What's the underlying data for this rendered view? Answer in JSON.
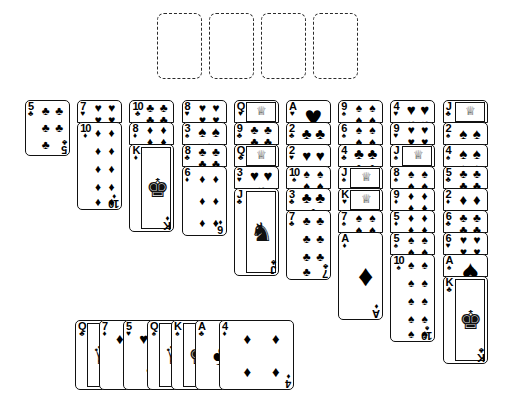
{
  "app": {
    "title": "Solitaire — FreeCell layout",
    "background_color": "#ffffff",
    "card_border_color": "#111111",
    "card_face_color": "#ffffff",
    "placeholder_border_color": "#2b2b2b"
  },
  "suits": {
    "spades": "♠",
    "hearts": "♥",
    "diamonds": "♦",
    "clubs": "♣"
  },
  "free_cells": {
    "count": 4,
    "label": "free-cell",
    "cards": [
      "",
      "",
      "",
      ""
    ]
  },
  "tableau": {
    "column_count": 9,
    "columns": [
      {
        "index": 1,
        "cards": [
          {
            "rank": "5",
            "suit": "clubs",
            "suit_glyph": "♣",
            "pip_count": 5
          }
        ]
      },
      {
        "index": 2,
        "cards": [
          {
            "rank": "7",
            "suit": "hearts",
            "suit_glyph": "♥",
            "pip_count": 7
          },
          {
            "rank": "10",
            "suit": "diamonds",
            "suit_glyph": "♦",
            "pip_count": 10
          }
        ]
      },
      {
        "index": 3,
        "cards": [
          {
            "rank": "10",
            "suit": "clubs",
            "suit_glyph": "♣",
            "pip_count": 10
          },
          {
            "rank": "8",
            "suit": "diamonds",
            "suit_glyph": "♦",
            "pip_count": 8
          },
          {
            "rank": "K",
            "suit": "diamonds",
            "suit_glyph": "♦",
            "pip_count": 0
          }
        ]
      },
      {
        "index": 4,
        "cards": [
          {
            "rank": "8",
            "suit": "hearts",
            "suit_glyph": "♥",
            "pip_count": 8
          },
          {
            "rank": "3",
            "suit": "spades",
            "suit_glyph": "♠",
            "pip_count": 3
          },
          {
            "rank": "8",
            "suit": "clubs",
            "suit_glyph": "♣",
            "pip_count": 8
          },
          {
            "rank": "6",
            "suit": "diamonds",
            "suit_glyph": "♦",
            "pip_count": 6
          }
        ]
      },
      {
        "index": 5,
        "cards": [
          {
            "rank": "Q",
            "suit": "hearts",
            "suit_glyph": "♥",
            "pip_count": 0
          },
          {
            "rank": "9",
            "suit": "clubs",
            "suit_glyph": "♣",
            "pip_count": 9
          },
          {
            "rank": "Q",
            "suit": "clubs",
            "suit_glyph": "♣",
            "pip_count": 0
          },
          {
            "rank": "3",
            "suit": "hearts",
            "suit_glyph": "♥",
            "pip_count": 3
          },
          {
            "rank": "J",
            "suit": "clubs",
            "suit_glyph": "♣",
            "pip_count": 0
          }
        ]
      },
      {
        "index": 6,
        "cards": [
          {
            "rank": "A",
            "suit": "hearts",
            "suit_glyph": "♥",
            "pip_count": 1
          },
          {
            "rank": "2",
            "suit": "clubs",
            "suit_glyph": "♣",
            "pip_count": 2
          },
          {
            "rank": "2",
            "suit": "hearts",
            "suit_glyph": "♥",
            "pip_count": 2
          },
          {
            "rank": "10",
            "suit": "spades",
            "suit_glyph": "♠",
            "pip_count": 10
          },
          {
            "rank": "3",
            "suit": "clubs",
            "suit_glyph": "♣",
            "pip_count": 3
          },
          {
            "rank": "7",
            "suit": "clubs",
            "suit_glyph": "♣",
            "pip_count": 7
          }
        ]
      },
      {
        "index": 7,
        "cards": [
          {
            "rank": "9",
            "suit": "spades",
            "suit_glyph": "♠",
            "pip_count": 9
          },
          {
            "rank": "6",
            "suit": "spades",
            "suit_glyph": "♠",
            "pip_count": 6
          },
          {
            "rank": "4",
            "suit": "clubs",
            "suit_glyph": "♣",
            "pip_count": 4
          },
          {
            "rank": "J",
            "suit": "spades",
            "suit_glyph": "♠",
            "pip_count": 0
          },
          {
            "rank": "K",
            "suit": "hearts",
            "suit_glyph": "♥",
            "pip_count": 0
          },
          {
            "rank": "7",
            "suit": "spades",
            "suit_glyph": "♠",
            "pip_count": 7
          },
          {
            "rank": "A",
            "suit": "diamonds",
            "suit_glyph": "♦",
            "pip_count": 1
          }
        ]
      },
      {
        "index": 8,
        "cards": [
          {
            "rank": "4",
            "suit": "hearts",
            "suit_glyph": "♥",
            "pip_count": 4
          },
          {
            "rank": "9",
            "suit": "hearts",
            "suit_glyph": "♥",
            "pip_count": 9
          },
          {
            "rank": "J",
            "suit": "spades",
            "suit_glyph": "♠",
            "pip_count": 0
          },
          {
            "rank": "8",
            "suit": "spades",
            "suit_glyph": "♠",
            "pip_count": 8
          },
          {
            "rank": "9",
            "suit": "diamonds",
            "suit_glyph": "♦",
            "pip_count": 9
          },
          {
            "rank": "5",
            "suit": "diamonds",
            "suit_glyph": "♦",
            "pip_count": 5
          },
          {
            "rank": "5",
            "suit": "spades",
            "suit_glyph": "♠",
            "pip_count": 5
          },
          {
            "rank": "10",
            "suit": "spades",
            "suit_glyph": "♠",
            "pip_count": 10
          }
        ]
      },
      {
        "index": 9,
        "cards": [
          {
            "rank": "J",
            "suit": "clubs",
            "suit_glyph": "♣",
            "pip_count": 0
          },
          {
            "rank": "2",
            "suit": "spades",
            "suit_glyph": "♠",
            "pip_count": 2
          },
          {
            "rank": "4",
            "suit": "spades",
            "suit_glyph": "♠",
            "pip_count": 4
          },
          {
            "rank": "5",
            "suit": "clubs",
            "suit_glyph": "♣",
            "pip_count": 5
          },
          {
            "rank": "2",
            "suit": "diamonds",
            "suit_glyph": "♦",
            "pip_count": 2
          },
          {
            "rank": "6",
            "suit": "clubs",
            "suit_glyph": "♣",
            "pip_count": 6
          },
          {
            "rank": "6",
            "suit": "hearts",
            "suit_glyph": "♥",
            "pip_count": 6
          },
          {
            "rank": "A",
            "suit": "spades",
            "suit_glyph": "♠",
            "pip_count": 1
          },
          {
            "rank": "K",
            "suit": "clubs",
            "suit_glyph": "♣",
            "pip_count": 0
          }
        ]
      }
    ]
  },
  "waste_row": {
    "label": "reserve-row",
    "cards": [
      {
        "rank": "Q",
        "suit": "clubs",
        "suit_glyph": "♣",
        "pip_count": 0
      },
      {
        "rank": "7",
        "suit": "diamonds",
        "suit_glyph": "♦",
        "pip_count": 3
      },
      {
        "rank": "5",
        "suit": "hearts",
        "suit_glyph": "♥",
        "pip_count": 3
      },
      {
        "rank": "Q",
        "suit": "spades",
        "suit_glyph": "♠",
        "pip_count": 0
      },
      {
        "rank": "K",
        "suit": "spades",
        "suit_glyph": "♠",
        "pip_count": 0
      },
      {
        "rank": "A",
        "suit": "clubs",
        "suit_glyph": "♣",
        "pip_count": 1
      },
      {
        "rank": "4",
        "suit": "diamonds",
        "suit_glyph": "♦",
        "pip_count": 4
      }
    ]
  }
}
